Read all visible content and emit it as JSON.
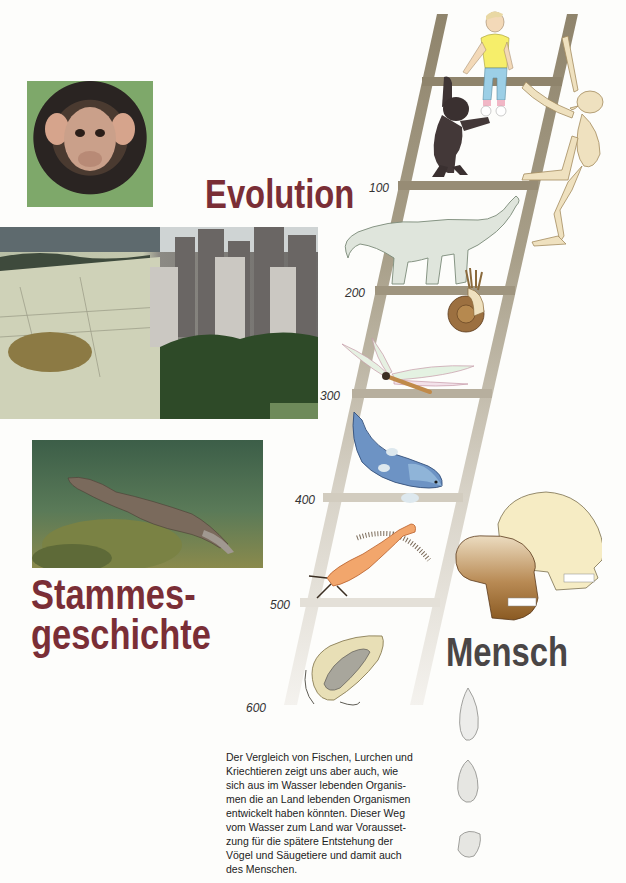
{
  "titles": {
    "evolution": "Evolution",
    "stammes_line1": "Stammes-",
    "stammes_line2": "geschichte",
    "mensch": "Mensch"
  },
  "ladder": {
    "scale_unit_note": "",
    "labels": [
      "100",
      "200",
      "300",
      "400",
      "500",
      "600"
    ],
    "rail_color": "#a39983",
    "rungs": [
      {
        "label": "100",
        "figure": "dinosaur-sauropod"
      },
      {
        "label": "200",
        "figure": "ammonite"
      },
      {
        "label": "300",
        "figure": "dragonfly"
      },
      {
        "label": "400",
        "figure": "lobe-finned-fish"
      },
      {
        "label": "500",
        "figure": "sea-scorpion"
      },
      {
        "label": "600",
        "figure": "trilobite"
      }
    ],
    "top_figures": [
      "boy-sitting-on-ladder",
      "ape-climbing",
      "skeleton-climbing"
    ]
  },
  "photos": [
    {
      "name": "chimpanzee-photo",
      "subject": "young chimpanzee"
    },
    {
      "name": "desert-city-photo",
      "subject": "cracked desert blending into city skyline with park"
    },
    {
      "name": "platypus-photo",
      "subject": "platypus swimming underwater"
    }
  ],
  "skulls": [
    "early-hominid-skull",
    "modern-human-skull"
  ],
  "stone_tools": [
    "hand-axe-leaf",
    "hand-axe-rough",
    "chopper-tool"
  ],
  "caption": {
    "text": "Der Vergleich von Fischen, Lurchen und Kriechtieren zeigt uns aber auch, wie sich aus im Wasser lebenden Organismen die an Land lebenden Organismen entwickelt haben könnten. Dieser Weg vom Wasser zum Land war Voraussetzung für die spätere Entstehung der Vögel und Säugetiere und damit auch des Menschen.",
    "lines": [
      "Der Vergleich von Fischen, Lurchen und",
      "Kriechtieren zeigt uns aber auch, wie",
      "sich aus im Wasser lebenden Organis-",
      "men die an Land lebenden Organismen",
      "entwickelt haben könnten. Dieser Weg",
      "vom Wasser zum Land war Vorausset-",
      "zung für die spätere Entstehung der",
      "Vögel und Säugetiere und damit auch",
      "des Menschen."
    ]
  },
  "colors": {
    "title_red": "#7a2e36",
    "title_grey": "#4a4646",
    "background": "#fdfdfb"
  }
}
